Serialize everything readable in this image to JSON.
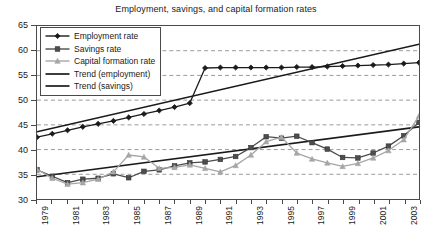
{
  "chart_data": {
    "type": "line",
    "title": "Employment, savings, and capital formation rates",
    "xlabel": "",
    "ylabel": "",
    "ylim": [
      30,
      65
    ],
    "y_ticks": [
      30,
      35,
      40,
      45,
      50,
      55,
      60,
      65
    ],
    "xlim": [
      1979,
      2004
    ],
    "x_ticks": [
      1979,
      1981,
      1983,
      1985,
      1987,
      1989,
      1991,
      1993,
      1995,
      1997,
      1999,
      2001,
      2003
    ],
    "x_tick_labels": [
      "1979",
      "1981",
      "1983",
      "1985",
      "1987",
      "1989",
      "1991",
      "1993",
      "1995",
      "1997",
      "1999",
      "2001",
      "2003"
    ],
    "x_all_years": [
      1979,
      1980,
      1981,
      1982,
      1983,
      1984,
      1985,
      1986,
      1987,
      1988,
      1989,
      1990,
      1991,
      1992,
      1993,
      1994,
      1995,
      1996,
      1997,
      1998,
      1999,
      2000,
      2001,
      2002,
      2003,
      2004
    ],
    "grid": "horizontal-dashed",
    "legend_position": "top-left",
    "series": [
      {
        "name": "Employment rate",
        "marker": "diamond",
        "color": "#1a1a1a",
        "values": [
          42.5,
          43.2,
          43.9,
          44.6,
          45.2,
          45.8,
          46.5,
          47.2,
          47.9,
          48.6,
          49.4,
          56.5,
          56.6,
          56.6,
          56.6,
          56.6,
          56.6,
          56.7,
          56.7,
          56.8,
          56.9,
          57.0,
          57.1,
          57.2,
          57.4,
          57.6
        ]
      },
      {
        "name": "Savings rate",
        "marker": "square",
        "color": "#4d4d4d",
        "values": [
          35.9,
          34.6,
          33.3,
          34.0,
          34.2,
          35.1,
          34.3,
          35.6,
          35.9,
          36.7,
          37.3,
          37.5,
          38.0,
          38.6,
          40.4,
          42.6,
          42.3,
          42.7,
          41.4,
          40.1,
          38.4,
          38.3,
          39.3,
          40.7,
          42.8,
          45.5
        ]
      },
      {
        "name": "Capital formation rate",
        "marker": "triangle",
        "color": "#a6a6a6",
        "values": [
          36.0,
          34.2,
          33.0,
          33.3,
          34.0,
          35.5,
          38.9,
          38.5,
          36.2,
          36.4,
          36.9,
          36.2,
          35.5,
          36.8,
          38.9,
          41.6,
          42.5,
          39.3,
          38.1,
          37.3,
          36.6,
          37.2,
          38.3,
          39.8,
          42.0,
          46.8
        ]
      }
    ],
    "trend_lines": [
      {
        "name": "Trend (employment)",
        "color": "#1a1a1a",
        "start": {
          "x": 1979,
          "y": 43.6
        },
        "end": {
          "x": 2004,
          "y": 61.3
        }
      },
      {
        "name": "Trend (savings)",
        "color": "#1a1a1a",
        "start": {
          "x": 1979,
          "y": 34.5
        },
        "end": {
          "x": 2004,
          "y": 44.6
        }
      }
    ],
    "legend_entries": [
      {
        "label": "Employment rate",
        "marker": "diamond",
        "color": "#1a1a1a"
      },
      {
        "label": "Savings rate",
        "marker": "square",
        "color": "#4d4d4d"
      },
      {
        "label": "Capital formation rate",
        "marker": "triangle",
        "color": "#a6a6a6"
      },
      {
        "label": "Trend (employment)",
        "marker": "line",
        "color": "#1a1a1a"
      },
      {
        "label": "Trend (savings)",
        "marker": "line",
        "color": "#1a1a1a"
      }
    ]
  }
}
